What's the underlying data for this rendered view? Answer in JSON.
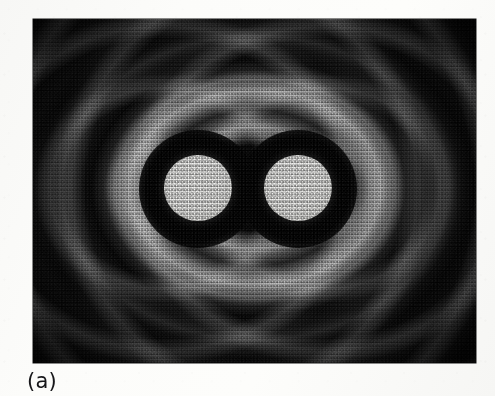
{
  "figure": {
    "caption": "(a)",
    "kind": "photograph",
    "plate": {
      "left": 33,
      "top": 19,
      "width": 443,
      "height": 344,
      "background_color": "#050505",
      "border_color": "#141414"
    },
    "page_background_color": "#fdfdfc",
    "caption_color": "#17171a"
  },
  "chart_data": {
    "type": "heatmap",
    "title": "(a)",
    "subtitle": "",
    "xlabel": "",
    "ylabel": "",
    "colormap": "grayscale",
    "value_range": [
      0,
      255
    ],
    "grid": false,
    "legend": "none",
    "sources": [
      {
        "name": "left-disc",
        "center_x": 198,
        "center_y": 189,
        "radius": 34,
        "peak_intensity": 240
      },
      {
        "name": "right-disc",
        "center_x": 298,
        "center_y": 189,
        "radius": 34,
        "peak_intensity": 240
      }
    ],
    "fringe_rings": [
      {
        "order": 0,
        "label": "central discs",
        "relative_radius": 0.0,
        "intensity": 240
      },
      {
        "order": 1,
        "label": "first dark moat",
        "relative_radius": 0.18,
        "intensity": 12
      },
      {
        "order": 2,
        "label": "first bright collar",
        "relative_radius": 0.3,
        "intensity": 150
      },
      {
        "order": 3,
        "label": "second dark band",
        "relative_radius": 0.42,
        "intensity": 18
      },
      {
        "order": 4,
        "label": "second bright oval",
        "relative_radius": 0.54,
        "intensity": 104
      },
      {
        "order": 5,
        "label": "third dark band",
        "relative_radius": 0.65,
        "intensity": 14
      },
      {
        "order": 6,
        "label": "third bright oval",
        "relative_radius": 0.75,
        "intensity": 72
      },
      {
        "order": 7,
        "label": "outer dark field",
        "relative_radius": 0.9,
        "intensity": 8
      }
    ],
    "background_intensity": 6,
    "noise": "photographic film grain, scanner raster"
  }
}
